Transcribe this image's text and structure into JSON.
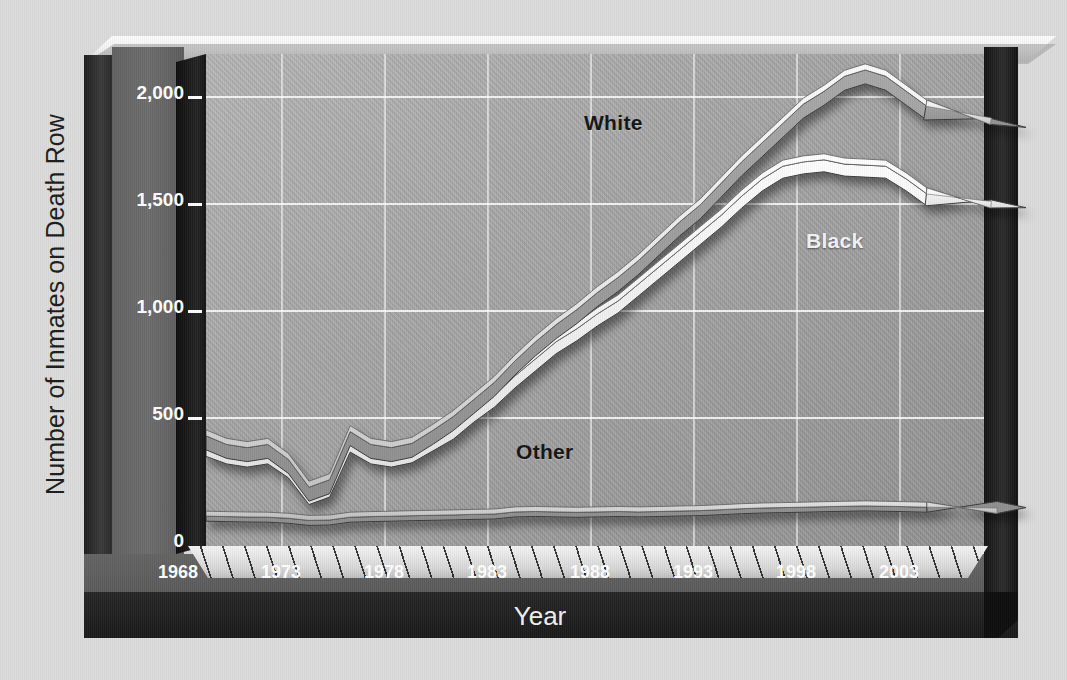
{
  "chart_data": {
    "type": "line",
    "title": "",
    "xlabel": "Year",
    "ylabel": "Number of Inmates on Death Row",
    "xlim": [
      1968,
      2004
    ],
    "ylim": [
      0,
      2250
    ],
    "grid": true,
    "legend_position": "inline-labels",
    "x_ticks": [
      "1968",
      "1973",
      "1978",
      "1983",
      "1988",
      "1993",
      "1998",
      "2003"
    ],
    "y_ticks": [
      "0",
      "500",
      "1,000",
      "1,500",
      "2,000"
    ],
    "x": [
      1968,
      1969,
      1970,
      1971,
      1972,
      1973,
      1974,
      1975,
      1976,
      1977,
      1978,
      1979,
      1980,
      1981,
      1982,
      1983,
      1984,
      1985,
      1986,
      1987,
      1988,
      1989,
      1990,
      1991,
      1992,
      1993,
      1994,
      1995,
      1996,
      1997,
      1998,
      1999,
      2000,
      2001,
      2002,
      2003,
      2004
    ],
    "series": [
      {
        "name": "White",
        "style": "gray-ribbon",
        "color": "#9a9a9a",
        "values": [
          440,
          400,
          385,
          400,
          330,
          200,
          235,
          460,
          400,
          385,
          405,
          465,
          530,
          610,
          690,
          790,
          880,
          960,
          1030,
          1110,
          1180,
          1260,
          1350,
          1440,
          1520,
          1620,
          1720,
          1810,
          1900,
          1990,
          2050,
          2120,
          2150,
          2120,
          2050,
          1980,
          1900
        ]
      },
      {
        "name": "Black",
        "style": "white-ribbon",
        "color": "#f2f2f2",
        "values": [
          400,
          365,
          350,
          365,
          300,
          175,
          210,
          420,
          365,
          350,
          370,
          425,
          480,
          560,
          630,
          720,
          800,
          880,
          940,
          1010,
          1070,
          1150,
          1230,
          1310,
          1390,
          1470,
          1560,
          1640,
          1700,
          1720,
          1730,
          1710,
          1705,
          1700,
          1640,
          1570,
          1520
        ]
      },
      {
        "name": "Other",
        "style": "thin-ribbon",
        "color": "#cfcfcf",
        "values": [
          60,
          58,
          56,
          55,
          50,
          40,
          42,
          55,
          58,
          60,
          62,
          64,
          66,
          68,
          70,
          80,
          82,
          80,
          78,
          80,
          82,
          80,
          82,
          84,
          86,
          90,
          95,
          98,
          100,
          102,
          104,
          106,
          108,
          106,
          104,
          102,
          100
        ]
      }
    ],
    "annotations": [
      {
        "label": "White",
        "x": 1988,
        "y": 1900
      },
      {
        "label": "Black",
        "x": 1998,
        "y": 1420
      },
      {
        "label": "Other",
        "x": 1984,
        "y": 290
      }
    ],
    "arrow_ends": true
  },
  "colors": {
    "page_background": "#dcdcdc",
    "plot_fill": "#a6a6a6",
    "axis_band": "#656565",
    "frame_dark": "#1a1a1a",
    "gridline": "#ffffff",
    "white_series": "#9a9a9a",
    "black_series": "#f2f2f2",
    "other_series": "#cfcfcf",
    "tick_text": "#ffffff",
    "axis_title_text": "#1b1b1b"
  }
}
